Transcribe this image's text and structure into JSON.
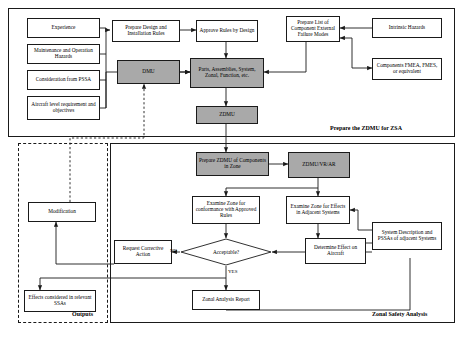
{
  "figure": {
    "colors": {
      "gray_fill": "#a9a9a9",
      "line": "#1a1a1a",
      "background": "#ffffff"
    }
  },
  "panels": [
    {
      "id": "prepare_zdmu",
      "label": "Prepare the ZDMU for ZSA",
      "style": "solid"
    },
    {
      "id": "zonal_safety",
      "label": "Zonal Safety Analysis",
      "style": "solid"
    },
    {
      "id": "outputs",
      "label": "Outputs",
      "style": "dashed"
    }
  ],
  "nodes": [
    {
      "id": "experience",
      "label": "Experience",
      "shape": "rect",
      "fill": "white"
    },
    {
      "id": "maintenance",
      "label": "Maintenance and Operation Hazards",
      "shape": "rect",
      "fill": "white"
    },
    {
      "id": "consideration",
      "label": "Consideration from PSSA",
      "shape": "rect",
      "fill": "white"
    },
    {
      "id": "aircraft_level",
      "label": "Aircraft level requirement and objectives",
      "shape": "rect",
      "fill": "white"
    },
    {
      "id": "prepare_rules",
      "label": "Prepare Design and Installation Rules",
      "shape": "rect",
      "fill": "white"
    },
    {
      "id": "approve_rules",
      "label": "Approve Rules by Design",
      "shape": "rect",
      "fill": "white"
    },
    {
      "id": "dmu",
      "label": "DMU",
      "shape": "rect",
      "fill": "gray"
    },
    {
      "id": "parts",
      "label": "Parts, Assemblies, System, Zonal, Function, etc.",
      "shape": "rect",
      "fill": "gray"
    },
    {
      "id": "zdmu",
      "label": "ZDMU",
      "shape": "rect",
      "fill": "gray"
    },
    {
      "id": "prepare_list",
      "label": "Prepare List of Component External Failure Modes",
      "shape": "rect",
      "fill": "white"
    },
    {
      "id": "intrinsic",
      "label": "Intrinsic Hazards",
      "shape": "rect",
      "fill": "white"
    },
    {
      "id": "fmea",
      "label": "Components FMEA, FMES, or equivalent",
      "shape": "rect",
      "fill": "white"
    },
    {
      "id": "prepare_zdmu_comp",
      "label": "Prepare ZDMU of Components in Zone",
      "shape": "rect",
      "fill": "gray"
    },
    {
      "id": "zdmu_vr_ar",
      "label": "ZDMU/VR/AR",
      "shape": "rect",
      "fill": "gray"
    },
    {
      "id": "examine_conformance",
      "label": "Examine Zone for conformance with Approved Rules",
      "shape": "rect",
      "fill": "white"
    },
    {
      "id": "examine_adjacent",
      "label": "Examine Zone for Effects in Adjacent Systems",
      "shape": "rect",
      "fill": "white"
    },
    {
      "id": "system_desc",
      "label": "System Description and PSSAs of adjacent Systems",
      "shape": "rect",
      "fill": "white"
    },
    {
      "id": "determine_effect",
      "label": "Determine Effect on Aircraft",
      "shape": "rect",
      "fill": "white"
    },
    {
      "id": "acceptable",
      "label": "Acceptable?",
      "shape": "diamond",
      "fill": "white"
    },
    {
      "id": "request_corrective",
      "label": "Request Corrective Action",
      "shape": "rect",
      "fill": "white"
    },
    {
      "id": "zonal_report",
      "label": "Zonal Analysis Report",
      "shape": "rect",
      "fill": "white"
    },
    {
      "id": "modification",
      "label": "Modification",
      "shape": "rect",
      "fill": "white"
    },
    {
      "id": "effects_ssa",
      "label": "Effects considered in relevant SSAs",
      "shape": "rect",
      "fill": "white"
    }
  ],
  "edge_labels": [
    {
      "id": "no_label",
      "text": "NO"
    },
    {
      "id": "yes_label",
      "text": "YES"
    }
  ],
  "edges": [
    {
      "from": "experience",
      "to": "prepare_rules",
      "style": "solid"
    },
    {
      "from": "maintenance",
      "to": "prepare_rules",
      "style": "solid"
    },
    {
      "from": "consideration",
      "to": "prepare_rules",
      "style": "solid"
    },
    {
      "from": "aircraft_level",
      "to": "prepare_rules",
      "style": "solid"
    },
    {
      "from": "experience",
      "to": "parts",
      "style": "solid"
    },
    {
      "from": "prepare_rules",
      "to": "approve_rules",
      "style": "solid"
    },
    {
      "from": "approve_rules",
      "to": "parts",
      "style": "solid"
    },
    {
      "from": "dmu",
      "to": "parts",
      "style": "solid"
    },
    {
      "from": "parts",
      "to": "zdmu",
      "style": "solid"
    },
    {
      "from": "prepare_list",
      "to": "parts",
      "style": "solid"
    },
    {
      "from": "intrinsic",
      "to": "prepare_list",
      "style": "solid"
    },
    {
      "from": "fmea",
      "to": "prepare_list",
      "style": "solid"
    },
    {
      "from": "zdmu",
      "to": "prepare_zdmu_comp",
      "style": "solid"
    },
    {
      "from": "prepare_zdmu_comp",
      "to": "zdmu_vr_ar",
      "style": "solid"
    },
    {
      "from": "zdmu_vr_ar",
      "to": "examine_conformance",
      "style": "solid"
    },
    {
      "from": "zdmu_vr_ar",
      "to": "examine_adjacent",
      "style": "solid"
    },
    {
      "from": "examine_conformance",
      "to": "acceptable",
      "style": "solid"
    },
    {
      "from": "examine_adjacent",
      "to": "determine_effect",
      "style": "solid"
    },
    {
      "from": "determine_effect",
      "to": "acceptable",
      "style": "solid"
    },
    {
      "from": "system_desc",
      "to": "examine_adjacent",
      "style": "solid"
    },
    {
      "from": "system_desc",
      "to": "determine_effect",
      "style": "solid"
    },
    {
      "from": "acceptable",
      "to": "request_corrective",
      "style": "solid",
      "label": "NO"
    },
    {
      "from": "acceptable",
      "to": "zonal_report",
      "style": "solid",
      "label": "YES"
    },
    {
      "from": "request_corrective",
      "to": "modification",
      "style": "solid"
    },
    {
      "from": "modification",
      "to": "dmu",
      "style": "dotted"
    },
    {
      "from": "acceptable",
      "to": "effects_ssa",
      "style": "solid"
    }
  ]
}
